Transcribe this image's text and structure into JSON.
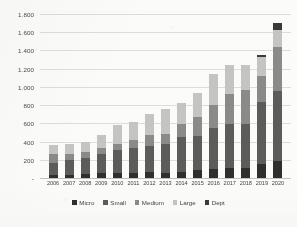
{
  "chart_data": {
    "type": "bar",
    "subtype": "stacked-column",
    "title": "",
    "xlabel": "",
    "ylabel": "",
    "ylim": [
      0,
      1800
    ],
    "ytick_step": 200,
    "grid": "horizontal",
    "legend_position": "bottom-center",
    "number_format": "european-thousands-separator-period",
    "categories": [
      "2006",
      "2007",
      "2008",
      "2009",
      "2010",
      "2011",
      "2012",
      "2013",
      "2014",
      "2015",
      "2016",
      "2017",
      "2018",
      "2019",
      "2020"
    ],
    "ytick_labels": [
      "-",
      "200",
      "400",
      "600",
      "800",
      "1.000",
      "1.200",
      "1.400",
      "1.600",
      "1.800"
    ],
    "ytick_values": [
      0,
      200,
      400,
      600,
      800,
      1000,
      1200,
      1400,
      1600,
      1800
    ],
    "series": [
      {
        "name": "Micro",
        "color": "#2f2f2f",
        "values": [
          30,
          35,
          40,
          50,
          55,
          60,
          65,
          55,
          70,
          85,
          100,
          110,
          105,
          155,
          185
        ]
      },
      {
        "name": "Small",
        "color": "#5c5c5c",
        "values": [
          140,
          165,
          175,
          215,
          250,
          275,
          290,
          320,
          375,
          380,
          450,
          485,
          490,
          675,
          775
        ]
      },
      {
        "name": "Medium",
        "color": "#8a8a8a",
        "values": [
          95,
          60,
          75,
          70,
          70,
          85,
          115,
          110,
          150,
          205,
          250,
          325,
          370,
          285,
          475
        ]
      },
      {
        "name": "Large",
        "color": "#c4c4c4",
        "values": [
          95,
          110,
          110,
          140,
          210,
          200,
          235,
          270,
          225,
          260,
          340,
          325,
          280,
          215,
          195
        ]
      },
      {
        "name": "Dept",
        "color": "#3a3a3a",
        "values": [
          0,
          0,
          0,
          0,
          0,
          0,
          0,
          0,
          0,
          0,
          0,
          0,
          0,
          25,
          75
        ]
      }
    ],
    "totals": [
      360,
      370,
      400,
      475,
      585,
      620,
      705,
      755,
      820,
      930,
      1140,
      1245,
      1245,
      1355,
      1705
    ]
  },
  "legend": {
    "items": [
      {
        "label": "Micro"
      },
      {
        "label": "Small"
      },
      {
        "label": "Medium"
      },
      {
        "label": "Large"
      },
      {
        "label": "Dept"
      }
    ]
  }
}
